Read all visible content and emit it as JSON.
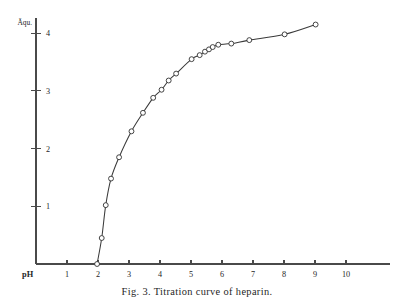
{
  "figure": {
    "caption": "Fig. 3. Titration curve of heparin.",
    "background_color": "#ffffff",
    "ink_color": "#3a3a3a"
  },
  "chart_data": {
    "type": "line",
    "title": "Fig. 3. Titration curve of heparin.",
    "xlabel": "pH",
    "ylabel": "Äqu.",
    "xlim": [
      0,
      10.8
    ],
    "ylim": [
      0,
      4.35
    ],
    "grid": false,
    "legend": null,
    "markers": "open-circle",
    "xticks": [
      1,
      2,
      3,
      4,
      5,
      6,
      7,
      8,
      9,
      10
    ],
    "xtick_labels": [
      "1",
      "2",
      "3",
      "4",
      "5",
      "6",
      "7",
      "8",
      "9",
      "10"
    ],
    "yticks": [
      1,
      2,
      3,
      4
    ],
    "ytick_labels": [
      "1",
      "2",
      "3",
      "4"
    ],
    "series": [
      {
        "name": "Titration curve of heparin",
        "x": [
          1.97,
          2.12,
          2.25,
          2.42,
          2.68,
          3.08,
          3.45,
          3.78,
          4.05,
          4.28,
          4.52,
          5.02,
          5.28,
          5.45,
          5.58,
          5.7,
          5.88,
          6.3,
          6.88,
          8.02,
          9.02
        ],
        "y": [
          0.0,
          0.45,
          1.02,
          1.48,
          1.85,
          2.3,
          2.62,
          2.88,
          3.02,
          3.18,
          3.3,
          3.55,
          3.62,
          3.68,
          3.72,
          3.76,
          3.8,
          3.82,
          3.88,
          3.98,
          4.15
        ]
      }
    ]
  }
}
